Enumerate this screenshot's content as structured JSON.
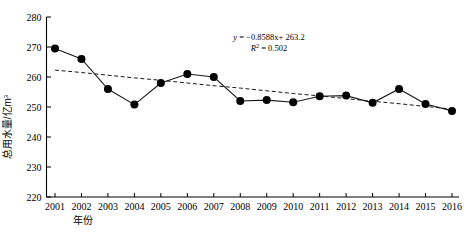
{
  "chart_data": {
    "type": "line",
    "title": "",
    "xlabel": "年份",
    "ylabel": "总用水量/亿m³",
    "ylabel_main": "总用水量/亿m",
    "ylabel_sup": "3",
    "categories": [
      "2001",
      "2002",
      "2003",
      "2004",
      "2005",
      "2006",
      "2007",
      "2008",
      "2009",
      "2010",
      "2011",
      "2012",
      "2013",
      "2014",
      "2015",
      "2016"
    ],
    "x": [
      2001,
      2002,
      2003,
      2004,
      2005,
      2006,
      2007,
      2008,
      2009,
      2010,
      2011,
      2012,
      2013,
      2014,
      2015,
      2016
    ],
    "values": [
      269.5,
      266.0,
      256.0,
      250.8,
      258.0,
      261.0,
      260.0,
      252.0,
      252.3,
      251.6,
      253.6,
      253.8,
      251.4,
      256.0,
      251.0,
      248.7
    ],
    "series": [
      {
        "name": "总用水量",
        "values": [
          269.5,
          266.0,
          256.0,
          250.8,
          258.0,
          261.0,
          260.0,
          252.0,
          252.3,
          251.6,
          253.6,
          253.8,
          251.4,
          256.0,
          251.0,
          248.7
        ],
        "marker": "filled-circle",
        "line_style": "solid",
        "color": "#000000"
      },
      {
        "name": "线性趋势线",
        "values": [
          262.3,
          261.5,
          260.6,
          259.7,
          258.9,
          258.0,
          257.1,
          256.3,
          255.4,
          254.5,
          253.7,
          252.8,
          251.9,
          251.1,
          250.2,
          249.3
        ],
        "marker": "none",
        "line_style": "dashed",
        "color": "#000000"
      }
    ],
    "ylim": [
      220,
      280
    ],
    "yticks": [
      220,
      230,
      240,
      250,
      260,
      270,
      280
    ],
    "ytick_labels": [
      "220",
      "230",
      "240",
      "250",
      "260",
      "270",
      "280"
    ],
    "xlim": [
      2000.5,
      2016.5
    ],
    "grid": false,
    "legend": "none",
    "annotations": {
      "equation_y": "y",
      "equation_body": " = −0.8588x+ 263.2",
      "equation_full": "y = −0.8588x+ 263.2",
      "r2_symbol": "R",
      "r2_sup": "2",
      "r2_value": " = 0.502",
      "r2_full": "R² = 0.502",
      "slope": -0.8588,
      "intercept": 263.2,
      "r_squared": 0.502
    }
  }
}
